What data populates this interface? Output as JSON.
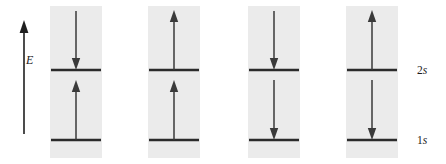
{
  "figure": {
    "type": "orbital-energy-level-diagram",
    "width": 446,
    "height": 164,
    "background_color": "#ffffff",
    "panel_color": "#ebebeb",
    "line_color": "#2b2b2b",
    "arrow_color": "#3a3a3a"
  },
  "axis": {
    "label": "E",
    "name": "energy-axis",
    "direction": "up",
    "icon": "up-arrow-icon"
  },
  "levels": [
    {
      "key": "2s",
      "label": "2s",
      "number": "2",
      "symbol": "s",
      "position": "upper"
    },
    {
      "key": "1s",
      "label": "1s",
      "number": "1",
      "symbol": "s",
      "position": "lower"
    }
  ],
  "panels": [
    {
      "index": 1,
      "name": "configuration-panel-1",
      "arrows": [
        {
          "level": "2s",
          "direction": "down",
          "icon": "down-arrow-icon"
        },
        {
          "level": "1s",
          "direction": "up",
          "icon": "up-arrow-icon"
        }
      ]
    },
    {
      "index": 2,
      "name": "configuration-panel-2",
      "arrows": [
        {
          "level": "2s",
          "direction": "up",
          "icon": "up-arrow-icon"
        },
        {
          "level": "1s",
          "direction": "up",
          "icon": "up-arrow-icon"
        }
      ]
    },
    {
      "index": 3,
      "name": "configuration-panel-3",
      "arrows": [
        {
          "level": "2s",
          "direction": "down",
          "icon": "down-arrow-icon"
        },
        {
          "level": "1s",
          "direction": "down",
          "icon": "down-arrow-icon"
        }
      ]
    },
    {
      "index": 4,
      "name": "configuration-panel-4",
      "arrows": [
        {
          "level": "2s",
          "direction": "up",
          "icon": "up-arrow-icon"
        },
        {
          "level": "1s",
          "direction": "down",
          "icon": "down-arrow-icon"
        }
      ]
    }
  ],
  "labels": {
    "label_2s_number": "2",
    "label_2s_symbol": "s",
    "label_1s_number": "1",
    "label_1s_symbol": "s"
  }
}
